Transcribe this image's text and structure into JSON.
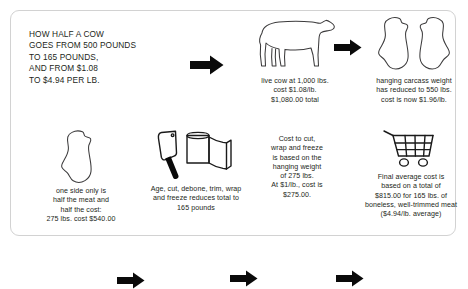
{
  "headline": {
    "lines": [
      "HOW HALF A COW",
      "GOES FROM 500 POUNDS",
      "TO 165 POUNDS,",
      "AND FROM $1.08",
      "TO $4.94 PER LB."
    ]
  },
  "steps": [
    {
      "id": "live-cow",
      "icon": "cow-icon",
      "caption": [
        "live cow at 1,000 lbs.",
        "cost $1.08/lb.",
        "$1,080.00 total"
      ]
    },
    {
      "id": "hanging-carcass",
      "icon": "carcass-halves-icon",
      "caption": [
        "hanging carcass weight",
        "has reduced to 550 lbs.",
        "cost is now $1.96/lb."
      ]
    },
    {
      "id": "one-side",
      "icon": "carcass-half-icon",
      "caption": [
        "one side only is",
        "half the meat and",
        "half the cost:",
        "275 lbs. cost $540.00"
      ]
    },
    {
      "id": "processing",
      "icon": "cleaver-and-butcher-paper-icon",
      "caption": [
        "Age, cut, debone, trim, wrap",
        "and freeze reduces total to",
        "165 pounds"
      ]
    },
    {
      "id": "processing-cost",
      "icon": "none",
      "caption": [
        "Cost to cut,",
        "wrap and freeze",
        "is based on the",
        "hanging weight",
        "of 275 lbs.",
        "At $1/lb., cost is",
        "$275.00."
      ]
    },
    {
      "id": "final-cost",
      "icon": "shopping-cart-icon",
      "caption": [
        "Final average cost is",
        "based on a total of",
        "$815.00 for 165 lbs. of",
        "boneless, well-trimmed meat",
        "($4.94/lb. average)"
      ]
    }
  ],
  "arrows": {
    "label": "flow-arrow",
    "count": 5
  },
  "colors": {
    "text": "#231f20",
    "line": "#3c3b3c",
    "arrow": "#0a0a0a",
    "card_border": "#d2d2d2",
    "background": "#ffffff"
  }
}
